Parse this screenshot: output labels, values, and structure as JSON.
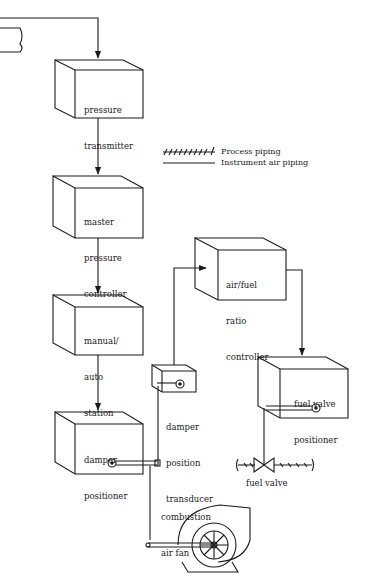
{
  "legend": {
    "process_piping": "Process piping",
    "instrument_air_piping": "Instrument air piping"
  },
  "blocks": {
    "pressure_transmitter": [
      "pressure",
      "transmitter"
    ],
    "master_pressure_controller": [
      "master",
      "pressure",
      "controller"
    ],
    "manual_auto_station": [
      "manual/",
      "auto",
      "station"
    ],
    "damper_positioner": [
      "damper",
      "positioner"
    ],
    "air_fuel_ratio_controller": [
      "air/fuel",
      "ratio",
      "controller"
    ],
    "fuel_valve_positioner": [
      "fuel valve",
      "positioner"
    ]
  },
  "labels": {
    "damper_position_transducer": [
      "damper",
      "position",
      "transducer"
    ],
    "fuel_valve": "fuel valve",
    "combustion_air_fan": [
      "combustion",
      "air fan"
    ]
  },
  "colors": {
    "line": "#1a1a1a",
    "background": "#ffffff"
  }
}
